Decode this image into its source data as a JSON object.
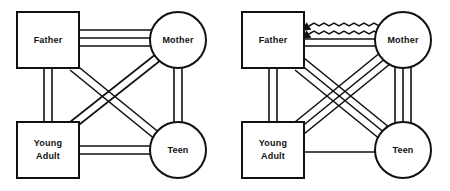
{
  "figure": {
    "type": "genogram-family-relationship-diagram",
    "panel_count": 2,
    "stroke_color": "#111111",
    "fill_color": "#ffffff",
    "background": "#ffffff"
  },
  "panels": [
    {
      "id": "left",
      "name": "left-diagram",
      "nodes": [
        {
          "id": "father",
          "label": "Father",
          "shape": "square",
          "x": 48,
          "y": 40,
          "w": 62,
          "h": 56
        },
        {
          "id": "mother",
          "label": "Mother",
          "shape": "circle",
          "x": 178,
          "y": 40,
          "r": 28
        },
        {
          "id": "young_adult",
          "label": "Young\nAdult",
          "shape": "square",
          "x": 48,
          "y": 150,
          "w": 62,
          "h": 56
        },
        {
          "id": "teen",
          "label": "Teen",
          "shape": "circle",
          "x": 178,
          "y": 150,
          "r": 28
        }
      ],
      "edges": [
        {
          "from": "father",
          "to": "mother",
          "style": "parallel",
          "lines": 3,
          "label": "father-mother"
        },
        {
          "from": "father",
          "to": "young_adult",
          "style": "parallel",
          "lines": 2,
          "label": "father-young-adult"
        },
        {
          "from": "mother",
          "to": "teen",
          "style": "parallel",
          "lines": 2,
          "label": "mother-teen"
        },
        {
          "from": "young_adult",
          "to": "teen",
          "style": "parallel",
          "lines": 2,
          "label": "young-adult-teen"
        },
        {
          "from": "father",
          "to": "teen",
          "style": "parallel",
          "lines": 2,
          "label": "father-teen-diagonal"
        },
        {
          "from": "young_adult",
          "to": "mother",
          "style": "parallel",
          "lines": 2,
          "label": "young-adult-mother-diagonal"
        }
      ]
    },
    {
      "id": "right",
      "name": "right-diagram",
      "nodes": [
        {
          "id": "father",
          "label": "Father",
          "shape": "square",
          "x": 48,
          "y": 40,
          "w": 62,
          "h": 56
        },
        {
          "id": "mother",
          "label": "Mother",
          "shape": "circle",
          "x": 178,
          "y": 40,
          "r": 28
        },
        {
          "id": "young_adult",
          "label": "Young\nAdult",
          "shape": "square",
          "x": 48,
          "y": 150,
          "w": 62,
          "h": 56
        },
        {
          "id": "teen",
          "label": "Teen",
          "shape": "circle",
          "x": 178,
          "y": 150,
          "r": 28
        }
      ],
      "edges": [
        {
          "from": "father",
          "to": "mother",
          "style": "zigzag-double-arrow",
          "lines": 2,
          "label": "father-mother-conflict"
        },
        {
          "from": "father",
          "to": "mother",
          "style": "parallel",
          "lines": 2,
          "label": "father-mother-straight"
        },
        {
          "from": "father",
          "to": "young_adult",
          "style": "parallel",
          "lines": 2,
          "label": "father-young-adult"
        },
        {
          "from": "mother",
          "to": "teen",
          "style": "parallel",
          "lines": 3,
          "label": "mother-teen"
        },
        {
          "from": "young_adult",
          "to": "teen",
          "style": "parallel",
          "lines": 1,
          "label": "young-adult-teen"
        },
        {
          "from": "father",
          "to": "teen",
          "style": "parallel",
          "lines": 3,
          "label": "father-teen-diagonal"
        },
        {
          "from": "young_adult",
          "to": "mother",
          "style": "parallel",
          "lines": 3,
          "label": "young-adult-mother-diagonal"
        }
      ]
    }
  ],
  "labels": {
    "father": "Father",
    "mother": "Mother",
    "young_adult_line1": "Young",
    "young_adult_line2": "Adult",
    "teen": "Teen"
  }
}
